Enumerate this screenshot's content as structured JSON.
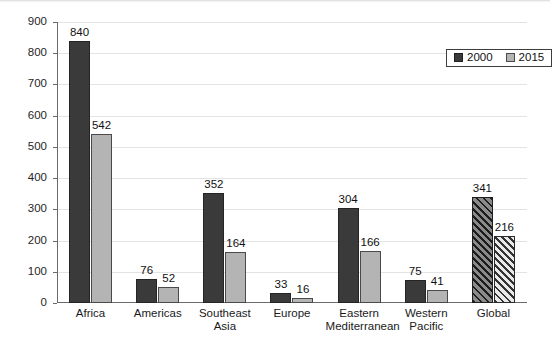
{
  "chart_data": {
    "type": "bar",
    "title": "",
    "subtitle": "",
    "xlabel": "",
    "ylabel": "",
    "ylim": [
      0,
      900
    ],
    "ytick_step": 100,
    "yticks": [
      "0",
      "100",
      "200",
      "300",
      "400",
      "500",
      "600",
      "700",
      "800",
      "900"
    ],
    "grid": true,
    "legend_position": "top-right-inside",
    "categories": [
      "Africa",
      "Americas",
      "Southeast\nAsia",
      "Europe",
      "Eastern\nMediterranean",
      "Western\nPacific",
      "Global"
    ],
    "series": [
      {
        "name": "2000",
        "values": [
          840,
          76,
          352,
          33,
          304,
          75,
          341
        ]
      },
      {
        "name": "2015",
        "values": [
          542,
          52,
          164,
          16,
          166,
          41,
          216
        ]
      }
    ],
    "hatched_categories": [
      "Global"
    ],
    "colors": {
      "series_2000": "#3a3a3a",
      "series_2015": "#b4b4b4",
      "gridline": "#e3e3e3",
      "axis": "#6b6b6b",
      "text": "#1a1a1a",
      "background": "#ffffff"
    }
  },
  "legend": {
    "items": [
      {
        "label": "2000",
        "swatch": "dark-square-swatch"
      },
      {
        "label": "2015",
        "swatch": "light-square-swatch"
      }
    ]
  }
}
